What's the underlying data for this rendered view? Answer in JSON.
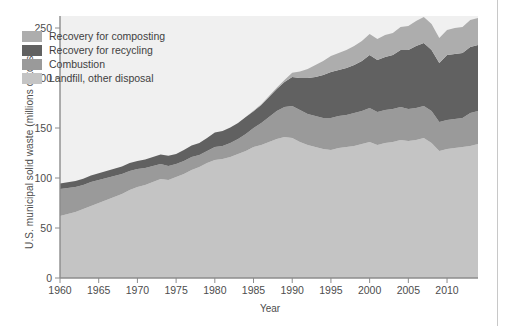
{
  "chart_data": {
    "type": "area",
    "title": "",
    "subtitle": "",
    "xlabel": "Year",
    "ylabel": "U.S. municipal solid waste (millions of tons)",
    "xlim": [
      1960,
      2014
    ],
    "ylim": [
      0,
      262
    ],
    "yticks": [
      0,
      50,
      100,
      150,
      200,
      250
    ],
    "xticks": [
      1960,
      1965,
      1970,
      1975,
      1980,
      1985,
      1990,
      1995,
      2000,
      2005,
      2010
    ],
    "grid": false,
    "stacked": true,
    "legend_position": "upper-left-inside",
    "x": [
      1960,
      1961,
      1962,
      1963,
      1964,
      1965,
      1966,
      1967,
      1968,
      1969,
      1970,
      1971,
      1972,
      1973,
      1974,
      1975,
      1976,
      1977,
      1978,
      1979,
      1980,
      1981,
      1982,
      1983,
      1984,
      1985,
      1986,
      1987,
      1988,
      1989,
      1990,
      1991,
      1992,
      1993,
      1994,
      1995,
      1996,
      1997,
      1998,
      1999,
      2000,
      2001,
      2002,
      2003,
      2004,
      2005,
      2006,
      2007,
      2008,
      2009,
      2010,
      2011,
      2012,
      2013,
      2014
    ],
    "series": [
      {
        "name": "Landfill, other disposal",
        "color": "#c4c4c4",
        "values": [
          62,
          64,
          66,
          69,
          72,
          75,
          78,
          81,
          84,
          88,
          91,
          93,
          96,
          99,
          98,
          101,
          104,
          108,
          111,
          115,
          118,
          119,
          121,
          124,
          127,
          131,
          133,
          136,
          139,
          141,
          140,
          136,
          133,
          131,
          129,
          128,
          130,
          131,
          132,
          134,
          136,
          133,
          135,
          136,
          138,
          137,
          138,
          140,
          135,
          127,
          129,
          130,
          131,
          132,
          134
        ]
      },
      {
        "name": "Combustion",
        "color": "#9a9a9a",
        "values": [
          27,
          26,
          25,
          24,
          24,
          23,
          22,
          21,
          20,
          19,
          18,
          17,
          16,
          15,
          14,
          13,
          13,
          13,
          12,
          12,
          13,
          13,
          14,
          15,
          17,
          19,
          22,
          25,
          28,
          30,
          32,
          32,
          31,
          31,
          31,
          32,
          32,
          32,
          33,
          33,
          34,
          33,
          33,
          33,
          33,
          32,
          32,
          32,
          32,
          29,
          29,
          29,
          29,
          33,
          33
        ]
      },
      {
        "name": "Recovery for recycling",
        "color": "#616161",
        "values": [
          5.6,
          5.8,
          6.0,
          6.2,
          6.5,
          6.7,
          7.0,
          7.3,
          7.6,
          8.0,
          8.0,
          8.5,
          9.0,
          9.5,
          10.3,
          9.9,
          11.0,
          11.5,
          12.0,
          13.0,
          14.5,
          15.0,
          15.5,
          16.0,
          17.0,
          16.7,
          18.0,
          20.0,
          22.0,
          25.0,
          29.0,
          32.0,
          36.0,
          39.0,
          43.0,
          46.0,
          46.0,
          47.0,
          48.0,
          50.0,
          53.0,
          52.0,
          53.0,
          54.0,
          57.0,
          59.0,
          62.0,
          63.0,
          61.0,
          59.0,
          65.0,
          65.0,
          65.0,
          66.0,
          66.0
        ]
      },
      {
        "name": "Recovery for composting",
        "color": "#adadad",
        "values": [
          0,
          0,
          0,
          0,
          0,
          0,
          0,
          0,
          0,
          0,
          0,
          0,
          0,
          0,
          0,
          0,
          0,
          0,
          0,
          0,
          0,
          0,
          0,
          0,
          0,
          0.5,
          0.7,
          0.9,
          1.2,
          2.0,
          4.2,
          6.5,
          9.0,
          12.0,
          14.0,
          16.0,
          17.0,
          18.0,
          19.0,
          20.0,
          21.0,
          21.0,
          22.0,
          22.0,
          23.0,
          24.0,
          25.0,
          26.0,
          26.0,
          25.0,
          25.0,
          26.0,
          26.0,
          27.0,
          27.0
        ]
      }
    ]
  },
  "legend": {
    "items": [
      {
        "label": "Recovery for composting",
        "color": "#adadad"
      },
      {
        "label": "Recovery for recycling",
        "color": "#616161"
      },
      {
        "label": "Combustion",
        "color": "#9a9a9a"
      },
      {
        "label": "Landfill, other disposal",
        "color": "#c4c4c4"
      }
    ]
  },
  "axes": {
    "y_tick_labels": [
      "0",
      "50",
      "100",
      "150",
      "200",
      "250"
    ],
    "x_tick_labels": [
      "1960",
      "1965",
      "1970",
      "1975",
      "1980",
      "1985",
      "1990",
      "1995",
      "2000",
      "2005",
      "2010"
    ],
    "y_axis_title": "U.S. municipal solid waste (millions of tons)",
    "x_axis_title": "Year"
  },
  "style": {
    "plot_background": "#f0f0f0",
    "axis_color": "#8c8c8c",
    "text_color": "#4d4d4d"
  }
}
